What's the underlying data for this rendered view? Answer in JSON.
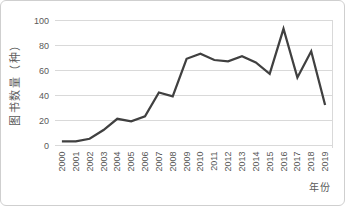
{
  "chart_data": {
    "type": "line",
    "title": "",
    "xlabel": "年份",
    "ylabel": "图书数量（种）",
    "categories": [
      "2000",
      "2001",
      "2002",
      "2003",
      "2004",
      "2005",
      "2006",
      "2007",
      "2008",
      "2009",
      "2010",
      "2011",
      "2012",
      "2013",
      "2014",
      "2015",
      "2016",
      "2017",
      "2018",
      "2019"
    ],
    "values": [
      3,
      3,
      5,
      12,
      21,
      19,
      23,
      42,
      39,
      69,
      73,
      68,
      67,
      71,
      66,
      57,
      93,
      54,
      75,
      32
    ],
    "ylim": [
      0,
      100
    ],
    "ytick_interval": 20,
    "ytick_labels": [
      "0",
      "20",
      "40",
      "60",
      "80",
      "100"
    ],
    "grid": "horizontal",
    "legend": "none",
    "colors": {
      "line": "#404040",
      "gridline": "#d9d9d9",
      "labels": "#595959",
      "frame_border": "#cfcfcf",
      "background": "#ffffff"
    }
  }
}
